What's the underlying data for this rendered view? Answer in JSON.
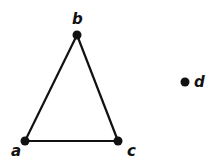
{
  "diagram": {
    "type": "graph",
    "background": "#ffffff",
    "ink_color": "#111111",
    "nodes": [
      {
        "id": "a",
        "label": "a",
        "x": 25,
        "y": 141,
        "label_x": 11,
        "label_y": 156
      },
      {
        "id": "b",
        "label": "b",
        "x": 77,
        "y": 35,
        "label_x": 72,
        "label_y": 24
      },
      {
        "id": "c",
        "label": "c",
        "x": 118,
        "y": 141,
        "label_x": 127,
        "label_y": 156
      },
      {
        "id": "d",
        "label": "d",
        "x": 185,
        "y": 82,
        "label_x": 194,
        "label_y": 87
      }
    ],
    "edges": [
      {
        "from": "a",
        "to": "b"
      },
      {
        "from": "b",
        "to": "c"
      },
      {
        "from": "a",
        "to": "c"
      }
    ]
  }
}
